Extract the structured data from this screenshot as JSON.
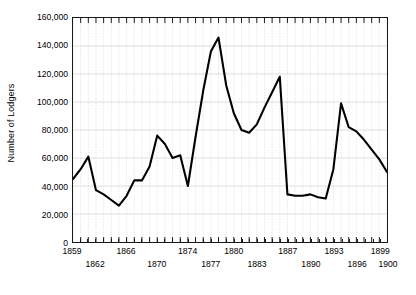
{
  "chart_data": {
    "type": "line",
    "title": "",
    "xlabel": "",
    "ylabel": "Number of Lodgers",
    "xlim": [
      1859,
      1900
    ],
    "ylim": [
      0,
      160000
    ],
    "grid": true,
    "legend": false,
    "y_ticks": [
      0,
      20000,
      40000,
      60000,
      80000,
      100000,
      120000,
      140000,
      160000
    ],
    "y_tick_labels": [
      "0",
      "20,000",
      "40,000",
      "60,000",
      "80,000",
      "100,000",
      "120,000",
      "140,000",
      "160,000"
    ],
    "x_tick_labels_row1": [
      "1859",
      "1866",
      "1874",
      "1880",
      "1887",
      "1893",
      "1899"
    ],
    "x_tick_labels_row2": [
      "1862",
      "1870",
      "1877",
      "1883",
      "1890",
      "1896",
      "1900"
    ],
    "x": [
      1859,
      1860,
      1861,
      1862,
      1863,
      1864,
      1865,
      1866,
      1867,
      1868,
      1869,
      1870,
      1871,
      1872,
      1873,
      1874,
      1875,
      1876,
      1877,
      1878,
      1879,
      1880,
      1881,
      1882,
      1883,
      1884,
      1885,
      1886,
      1887,
      1888,
      1889,
      1890,
      1891,
      1892,
      1893,
      1894,
      1895,
      1896,
      1897,
      1898,
      1899,
      1900
    ],
    "series": [
      {
        "name": "Number of Lodgers",
        "color": "#000000",
        "values": [
          45000,
          52000,
          61000,
          37000,
          34000,
          30000,
          26000,
          33000,
          44000,
          44000,
          54000,
          76000,
          70000,
          60000,
          62000,
          40000,
          75000,
          108000,
          136000,
          146000,
          112000,
          92000,
          80000,
          78000,
          84000,
          96000,
          107000,
          118000,
          34000,
          33000,
          33000,
          34000,
          32000,
          31000,
          52000,
          99000,
          82000,
          79000,
          73000,
          66000,
          59000,
          50000
        ]
      }
    ]
  }
}
